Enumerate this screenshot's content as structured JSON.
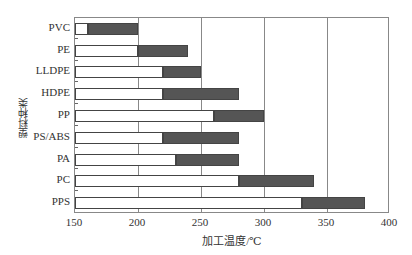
{
  "chart_data": {
    "type": "bar",
    "orientation": "horizontal-range",
    "title": "",
    "xlabel": "加工温度/℃",
    "ylabel": "塑料种类",
    "xlim": [
      150,
      400
    ],
    "xticks": [
      "150",
      "200",
      "250",
      "300",
      "350",
      "400"
    ],
    "grid": "vertical",
    "categories": [
      "PVC",
      "PE",
      "LLDPE",
      "HDPE",
      "PP",
      "PS/ABS",
      "PA",
      "PC",
      "PPS"
    ],
    "series": [
      {
        "name": "range_start",
        "values": [
          160,
          200,
          220,
          220,
          260,
          220,
          230,
          280,
          330
        ]
      },
      {
        "name": "range_end",
        "values": [
          200,
          240,
          250,
          280,
          300,
          280,
          280,
          340,
          380
        ]
      }
    ]
  }
}
